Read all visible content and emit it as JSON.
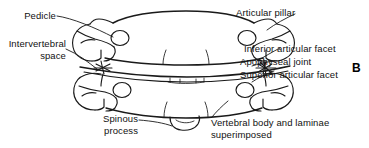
{
  "figure": {
    "panel_letter": "B",
    "line_color": "#1a1a1a",
    "background_color": "#ffffff"
  },
  "labels": {
    "pedicle": "Pedicle",
    "intervertebral_space_line1": "Intervertebral",
    "intervertebral_space_line2": "space",
    "spinous_process_line1": "Spinous",
    "spinous_process_line2": "process",
    "articular_pillar": "Articular pillar",
    "inferior_articular_facet": "Inferior articular facet",
    "apophyseal_joint": "Apophyseal joint",
    "superior_articular_facet": "Superior articular facet",
    "vertebral_body_line1": "Vertebral body and laminae",
    "vertebral_body_line2": "superimposed"
  }
}
